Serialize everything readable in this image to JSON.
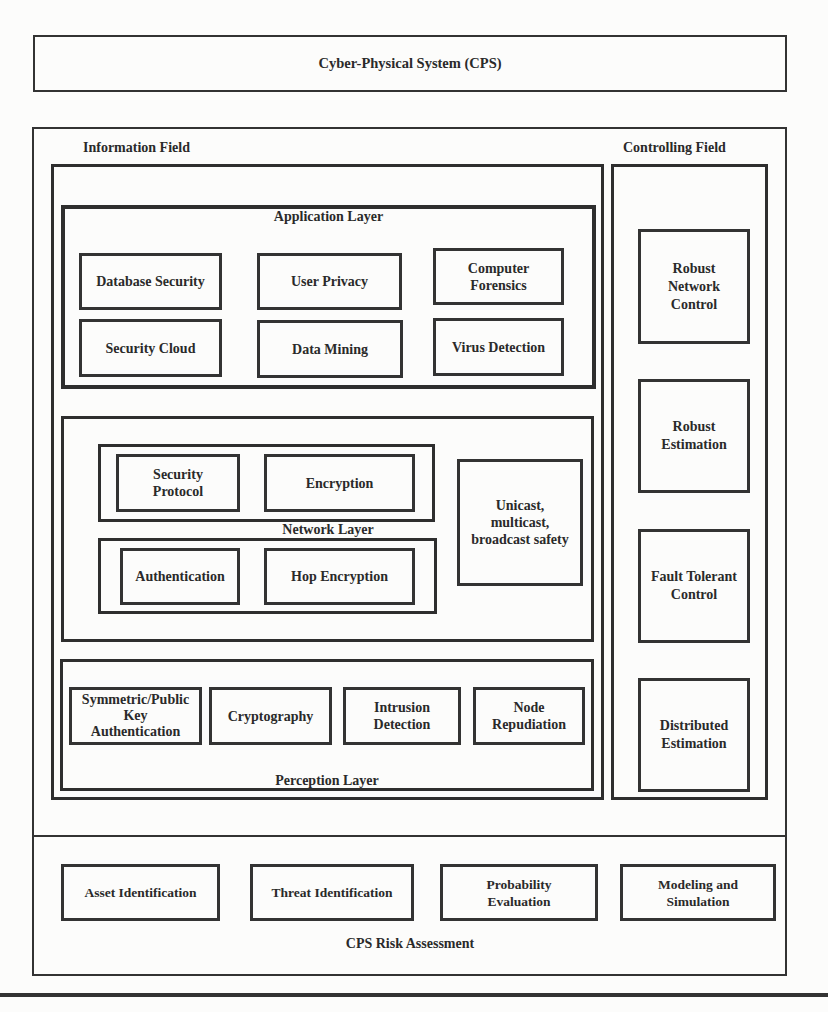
{
  "title": "Cyber-Physical System (CPS)",
  "information_field": {
    "label": "Information Field",
    "application_layer": {
      "label": "Application Layer",
      "items": [
        "Database Security",
        "User Privacy",
        "Computer\nForensics",
        "Security Cloud",
        "Data Mining",
        "Virus Detection"
      ]
    },
    "network_layer": {
      "label": "Network Layer",
      "group_top": [
        "Security\nProtocol",
        "Encryption"
      ],
      "group_bottom": [
        "Authentication",
        "Hop Encryption"
      ],
      "side": "Unicast,\nmulticast,\nbroadcast safety"
    },
    "perception_layer": {
      "label": "Perception Layer",
      "items": [
        "Symmetric/Public\nKey\nAuthentication",
        "Cryptography",
        "Intrusion\nDetection",
        "Node\nRepudiation"
      ]
    }
  },
  "controlling_field": {
    "label": "Controlling Field",
    "items": [
      "Robust\nNetwork\nControl",
      "Robust\nEstimation",
      "Fault Tolerant\nControl",
      "Distributed\nEstimation"
    ]
  },
  "risk_assessment": {
    "label": "CPS Risk Assessment",
    "items": [
      "Asset Identification",
      "Threat Identification",
      "Probability\nEvaluation",
      "Modeling and\nSimulation"
    ]
  }
}
